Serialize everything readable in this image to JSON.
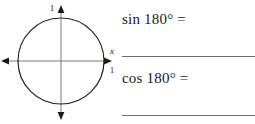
{
  "figure": {
    "name": "unit-circle",
    "radius_label_y": "1",
    "radius_label_x": "1",
    "x_axis_label": "x",
    "circle_color": "#222222",
    "axis_color": "#7a7a7a"
  },
  "problems": [
    {
      "id": "sin",
      "prompt": "sin 180° =",
      "answer": ""
    },
    {
      "id": "cos",
      "prompt": "cos 180° =",
      "answer": ""
    }
  ],
  "rule_color": "#6f6f6f"
}
